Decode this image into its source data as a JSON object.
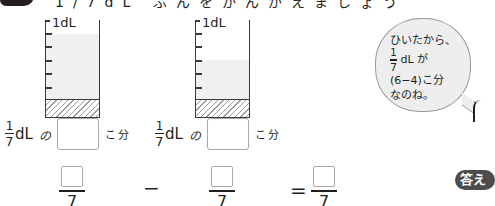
{
  "header": {
    "clipped_text": "1/7dL ぶんをかんがえましょう"
  },
  "beakers": [
    {
      "label": "1dL",
      "total_parts": 7,
      "filled_parts": 6,
      "fill_color": "#f0f0f0"
    },
    {
      "label": "1dL",
      "total_parts": 7,
      "filled_parts": 4,
      "fill_color": "#f0f0f0"
    }
  ],
  "unit_rows": [
    {
      "fraction_num": "1",
      "fraction_den": "7",
      "unit": "dL",
      "particle": "の",
      "answer": "",
      "suffix": "こ分"
    },
    {
      "fraction_num": "1",
      "fraction_den": "7",
      "unit": "dL",
      "particle": "の",
      "answer": "",
      "suffix": "こ分"
    }
  ],
  "equation": {
    "terms": [
      {
        "numerator": "",
        "denominator": "7"
      },
      {
        "numerator": "",
        "denominator": "7"
      },
      {
        "numerator": "",
        "denominator": "7"
      }
    ],
    "operator_minus": "−",
    "operator_equals": "="
  },
  "speech_bubble": {
    "line1": "ひいたから、",
    "frac_num": "1",
    "frac_den": "7",
    "line2_rest": "dL が",
    "line3": "(6−4)こ分",
    "line4": "なのね。"
  },
  "answer_badge": {
    "label": "答え"
  }
}
